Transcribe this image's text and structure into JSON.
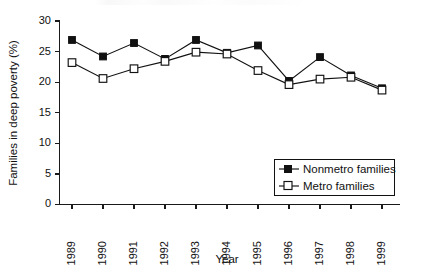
{
  "chart_data": {
    "type": "line",
    "title": "",
    "xlabel": "Year",
    "ylabel": "Families in deep poverty (%)",
    "x": [
      1989,
      1990,
      1991,
      1992,
      1993,
      1994,
      1995,
      1996,
      1997,
      1998,
      1999
    ],
    "xtick_labels": [
      "1989",
      "1990",
      "1991",
      "1992",
      "1993",
      "1994",
      "1995",
      "1996",
      "1997",
      "1998",
      "1999"
    ],
    "ytick_labels": [
      "0",
      "5",
      "10",
      "15",
      "20",
      "25",
      "30"
    ],
    "yticks": [
      0,
      5,
      10,
      15,
      20,
      25,
      30
    ],
    "ylim": [
      0,
      30
    ],
    "grid": false,
    "legend_position": "inside-lower-right",
    "series": [
      {
        "name": "Nonmetro families",
        "marker": "filled-square",
        "values": [
          26.9,
          24.2,
          26.4,
          23.8,
          26.9,
          24.8,
          26.0,
          20.2,
          24.1,
          21.1,
          19.0
        ]
      },
      {
        "name": "Metro families",
        "marker": "open-square",
        "values": [
          23.2,
          20.6,
          22.2,
          23.4,
          24.9,
          24.6,
          21.9,
          19.6,
          20.5,
          20.8,
          18.7
        ]
      }
    ],
    "colors": {
      "line": "#111111",
      "marker_fill": "#111111",
      "marker_open_fill": "#ffffff",
      "axis": "#1a1a1a",
      "background": "#ffffff"
    }
  },
  "legend": {
    "entries": [
      {
        "label": "Nonmetro families",
        "marker": "filled-square"
      },
      {
        "label": "Metro families",
        "marker": "open-square"
      }
    ]
  }
}
